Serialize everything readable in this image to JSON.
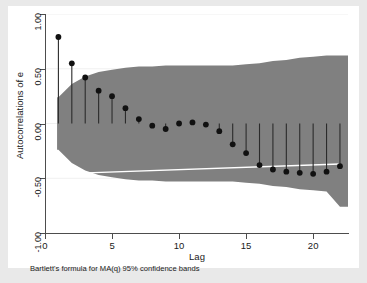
{
  "chart_data": {
    "type": "scatter",
    "title": "",
    "subtitle": "",
    "xlabel": "Lag",
    "ylabel": "Autocorrelations of e",
    "footnote": "Bartlett's formula for MA(q) 95% confidence bands",
    "grid": true,
    "legend": "none",
    "xlim": [
      0,
      22.6
    ],
    "ylim": [
      -1.0,
      1.0
    ],
    "xticks": [
      0,
      5,
      10,
      15,
      20
    ],
    "xtick_labels": [
      "0",
      "5",
      "10",
      "15",
      "20"
    ],
    "yticks": [
      1.0,
      0.5,
      0.0,
      -0.5,
      -1.0
    ],
    "ytick_labels": [
      "1.00",
      "0.50",
      "0.00",
      "-0.50",
      "-1.00"
    ],
    "x": [
      1,
      2,
      3,
      4,
      5,
      6,
      7,
      8,
      9,
      10,
      11,
      12,
      13,
      14,
      15,
      16,
      17,
      18,
      19,
      20,
      21,
      22
    ],
    "values": [
      0.79,
      0.55,
      0.42,
      0.3,
      0.25,
      0.14,
      0.04,
      -0.02,
      -0.05,
      0.0,
      0.01,
      -0.01,
      -0.07,
      -0.19,
      -0.27,
      -0.38,
      -0.42,
      -0.44,
      -0.45,
      -0.46,
      -0.44,
      -0.39
    ],
    "series": [
      {
        "name": "Autocorrelations of e",
        "type": "stem-marker",
        "marker_color": "#111111",
        "stem_color": "#2b2b2b",
        "values": [
          0.79,
          0.55,
          0.42,
          0.3,
          0.25,
          0.14,
          0.04,
          -0.02,
          -0.05,
          0.0,
          0.01,
          -0.01,
          -0.07,
          -0.19,
          -0.27,
          -0.38,
          -0.42,
          -0.44,
          -0.45,
          -0.46,
          -0.44,
          -0.39
        ]
      },
      {
        "name": "Bartlett 95% confidence band (upper)",
        "type": "band-upper",
        "band_color": "#808080",
        "values": [
          0.24,
          0.36,
          0.43,
          0.47,
          0.49,
          0.51,
          0.52,
          0.52,
          0.53,
          0.53,
          0.53,
          0.53,
          0.53,
          0.53,
          0.54,
          0.55,
          0.57,
          0.58,
          0.6,
          0.61,
          0.62,
          0.62
        ]
      },
      {
        "name": "Bartlett 95% confidence band (lower)",
        "type": "band-lower",
        "band_color": "#808080",
        "values": [
          -0.24,
          -0.36,
          -0.43,
          -0.47,
          -0.49,
          -0.51,
          -0.52,
          -0.52,
          -0.53,
          -0.53,
          -0.53,
          -0.53,
          -0.53,
          -0.53,
          -0.54,
          -0.55,
          -0.57,
          -0.58,
          -0.6,
          -0.61,
          -0.62,
          -0.76
        ]
      }
    ],
    "reference_line": {
      "name": "lower-band-guideline",
      "color": "#ffffff",
      "from": [
        1,
        -0.46
      ],
      "to": [
        22,
        -0.37
      ]
    },
    "gridlines_y": [
      1.0,
      0.5,
      0.0,
      -0.5
    ],
    "gridline_color": "#f0f0f0",
    "background": "#ffffff",
    "outer_background": "#e9e9e9"
  }
}
